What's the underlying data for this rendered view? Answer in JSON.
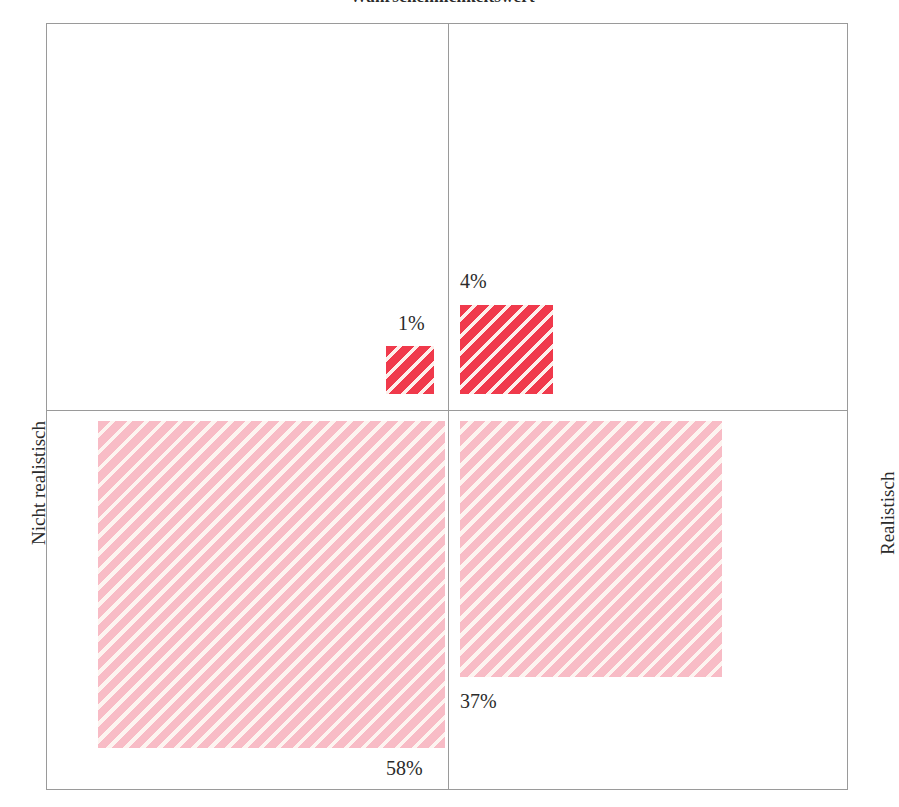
{
  "chart": {
    "title": "Wahrscheinlichkeitswert",
    "axis_left_label": "Nicht realistisch",
    "axis_right_label": "Realistisch"
  },
  "chart_data": {
    "type": "bar",
    "title": "Wahrscheinlichkeitswert",
    "subtitle": "",
    "xlabel": "",
    "ylabel": "",
    "grid": false,
    "legend_position": "none",
    "layout": "four-quadrant area-proportional squares (mosaic / quadrant plot)",
    "axis_labels": {
      "left": "Nicht realistisch",
      "right": "Realistisch"
    },
    "quadrants": [
      {
        "id": "top-left",
        "position": "upper-left",
        "value": null,
        "label": "",
        "color": "",
        "note": "empty quadrant, no square drawn"
      },
      {
        "id": "top-left-inner",
        "position": "upper-left (square anchored bottom-right of quadrant)",
        "value": 1,
        "label": "1%",
        "color": "#f03a4c",
        "hatch": "diagonal stripes",
        "label_position": "above-left of square"
      },
      {
        "id": "top-right",
        "position": "upper-right (square anchored bottom-left of quadrant)",
        "value": 4,
        "label": "4%",
        "color": "#f03a4c",
        "hatch": "diagonal stripes",
        "label_position": "above-left of square"
      },
      {
        "id": "bottom-left",
        "position": "lower-left (square anchored top-right of quadrant)",
        "value": 58,
        "label": "58%",
        "color": "#f8bcc6",
        "hatch": "diagonal stripes",
        "label_position": "below-right of square"
      },
      {
        "id": "bottom-right",
        "position": "lower-right (square anchored top-left of quadrant)",
        "value": 37,
        "label": "37%",
        "color": "#f8bcc6",
        "hatch": "diagonal stripes",
        "label_position": "below-left of square"
      }
    ],
    "categories": [
      "1%",
      "4%",
      "58%",
      "37%"
    ],
    "values": [
      1,
      4,
      58,
      37
    ],
    "value_labels": [
      "1%",
      "4%",
      "58%",
      "37%"
    ],
    "total": 100,
    "colors": {
      "strong_red": "#f03a4c",
      "light_pink": "#f8bcc6",
      "hatch_gap": "#fdf2ee",
      "frame_line": "#9a9a9a",
      "text": "#2b2b2b"
    }
  }
}
